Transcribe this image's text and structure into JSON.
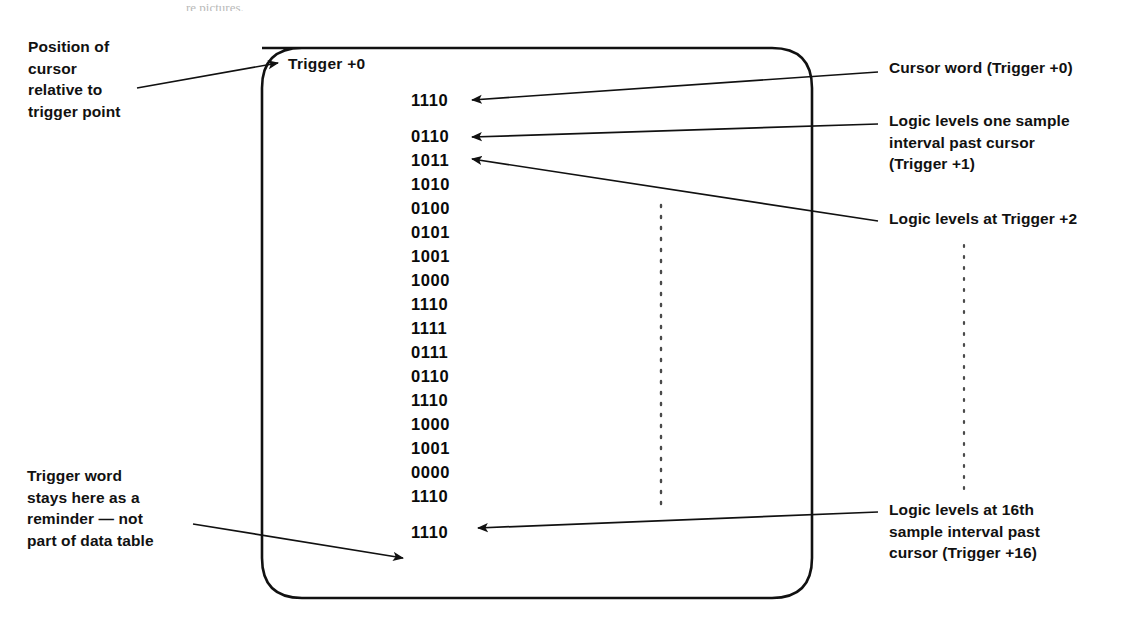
{
  "figure": {
    "title_fragment": "re pictures.",
    "screen_label": "Trigger +0",
    "data_words": [
      "1110",
      "0110",
      "1011",
      "1010",
      "0100",
      "0101",
      "1001",
      "1000",
      "1110",
      "1111",
      "0111",
      "0110",
      "1110",
      "1000",
      "1001",
      "0000",
      "1110",
      "1110"
    ],
    "callouts": {
      "position_of_cursor": "Position of\ncursor\nrelative to\ntrigger point",
      "trigger_word_reminder": "Trigger word\nstays here as a\nreminder — not\npart of data table",
      "cursor_word": "Cursor word (Trigger +0)",
      "logic_levels_one_sample": "Logic levels one sample\ninterval past cursor\n(Trigger +1)",
      "logic_levels_trigger2": "Logic levels at Trigger +2",
      "logic_levels_16th": "Logic levels at 16th\nsample interval past\ncursor (Trigger +16)"
    },
    "colors": {
      "ink": "#111111",
      "paper": "#ffffff",
      "dotted": "#555555"
    }
  }
}
